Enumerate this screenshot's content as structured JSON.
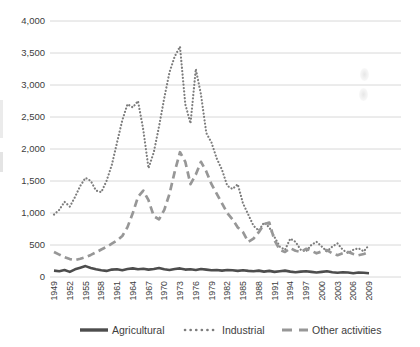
{
  "chart_data": {
    "type": "line",
    "title": "",
    "xlabel": "",
    "ylabel": "",
    "ylim": [
      0,
      4000
    ],
    "grid": "horizontal",
    "legend_position": "bottom",
    "y_ticks": [
      "0",
      "500",
      "1,000",
      "1,500",
      "2,000",
      "2,500",
      "3,000",
      "3,500",
      "4,000"
    ],
    "x": [
      1949,
      1950,
      1951,
      1952,
      1953,
      1954,
      1955,
      1956,
      1957,
      1958,
      1959,
      1960,
      1961,
      1962,
      1963,
      1964,
      1965,
      1966,
      1967,
      1968,
      1969,
      1970,
      1971,
      1972,
      1973,
      1974,
      1975,
      1976,
      1977,
      1978,
      1979,
      1980,
      1981,
      1982,
      1983,
      1984,
      1985,
      1986,
      1987,
      1988,
      1989,
      1990,
      1991,
      1992,
      1993,
      1994,
      1995,
      1996,
      1997,
      1998,
      1999,
      2000,
      2001,
      2002,
      2003,
      2004,
      2005,
      2006,
      2007,
      2008,
      2009
    ],
    "x_tick_labels": [
      "1949",
      "1952",
      "1955",
      "1958",
      "1961",
      "1964",
      "1967",
      "1970",
      "1973",
      "1976",
      "1979",
      "1982",
      "1985",
      "1988",
      "1991",
      "1994",
      "1997",
      "2000",
      "2003",
      "2006",
      "2009"
    ],
    "x_tick_step": 3,
    "series": [
      {
        "name": "Agricultural",
        "style": "solid",
        "color": "#4d4d4d",
        "values": [
          100,
          90,
          110,
          80,
          120,
          145,
          170,
          140,
          120,
          105,
          95,
          115,
          120,
          105,
          125,
          135,
          120,
          130,
          115,
          125,
          140,
          120,
          110,
          125,
          135,
          115,
          120,
          110,
          125,
          115,
          105,
          110,
          100,
          110,
          105,
          95,
          105,
          95,
          90,
          100,
          85,
          95,
          80,
          90,
          100,
          85,
          75,
          85,
          90,
          80,
          70,
          80,
          90,
          75,
          65,
          75,
          70,
          60,
          70,
          65,
          60
        ]
      },
      {
        "name": "Industrial",
        "style": "dotted",
        "color": "#7d7d7d",
        "values": [
          975,
          1050,
          1175,
          1100,
          1250,
          1425,
          1550,
          1500,
          1350,
          1325,
          1500,
          1750,
          2100,
          2450,
          2700,
          2650,
          2750,
          2300,
          1700,
          1950,
          2350,
          2800,
          3200,
          3450,
          3600,
          2700,
          2400,
          3250,
          2850,
          2250,
          2100,
          1850,
          1675,
          1425,
          1375,
          1450,
          1150,
          975,
          800,
          725,
          850,
          775,
          625,
          475,
          425,
          600,
          550,
          425,
          400,
          500,
          550,
          475,
          400,
          475,
          525,
          425,
          375,
          425,
          450,
          400,
          500
        ]
      },
      {
        "name": "Other activities",
        "style": "dashed",
        "color": "#979797",
        "values": [
          390,
          350,
          310,
          280,
          265,
          285,
          310,
          345,
          385,
          430,
          470,
          520,
          570,
          640,
          780,
          1000,
          1250,
          1350,
          1200,
          950,
          900,
          1050,
          1300,
          1650,
          1950,
          1800,
          1450,
          1600,
          1800,
          1650,
          1450,
          1300,
          1150,
          1000,
          900,
          775,
          700,
          550,
          600,
          700,
          825,
          850,
          575,
          425,
          390,
          450,
          410,
          390,
          440,
          410,
          370,
          400,
          420,
          370,
          340,
          370,
          390,
          360,
          340,
          360,
          390
        ]
      }
    ],
    "colors": {
      "gridline": "#d8d8d8",
      "axis_text": "#404040",
      "background": "#ffffff"
    }
  }
}
